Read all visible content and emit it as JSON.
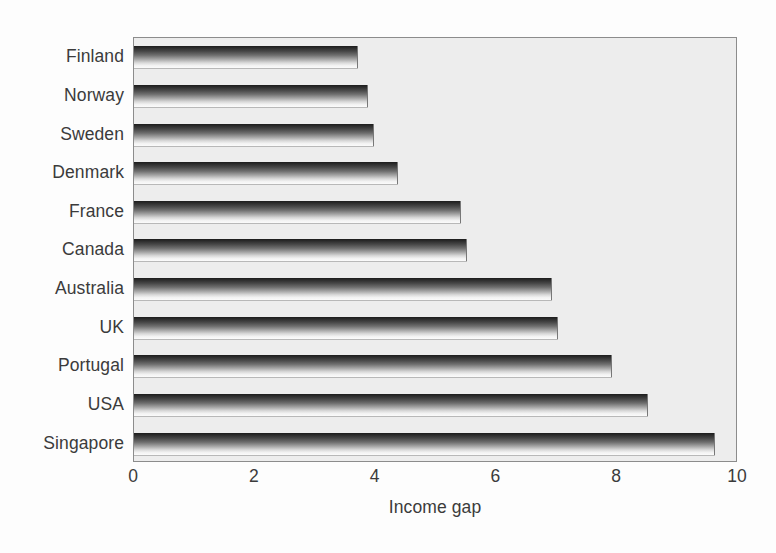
{
  "chart_data": {
    "type": "bar",
    "orientation": "horizontal",
    "title": "",
    "xlabel": "Income gap",
    "ylabel": "",
    "xlim": [
      0,
      10
    ],
    "xticks": [
      0,
      2,
      4,
      6,
      8,
      10
    ],
    "xtick_labels": [
      "0",
      "2",
      "4",
      "6",
      "8",
      "10"
    ],
    "grid": false,
    "legend": null,
    "categories": [
      "Finland",
      "Norway",
      "Sweden",
      "Denmark",
      "France",
      "Canada",
      "Australia",
      "UK",
      "Portugal",
      "USA",
      "Singapore"
    ],
    "values": [
      3.7,
      3.85,
      3.95,
      4.35,
      5.4,
      5.5,
      6.9,
      7.0,
      7.9,
      8.5,
      9.6
    ],
    "bar_fill": "gradient-dark-to-light",
    "plot_background": "#ededed",
    "text_color": "#3b3b3b"
  },
  "axis": {
    "x_title": "Income gap"
  }
}
